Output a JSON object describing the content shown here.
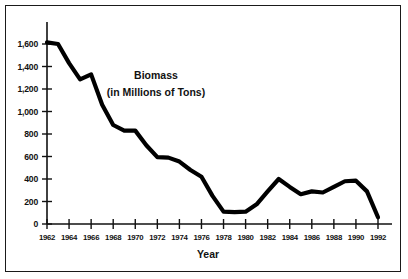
{
  "figure": {
    "background_color": "#ffffff",
    "border_color": "#1a1a1a",
    "line_color": "#000000"
  },
  "annotation": {
    "line1": "Biomass",
    "line2": "(in Millions of Tons)"
  },
  "axes": {
    "x_title": "Year",
    "y_title": ""
  },
  "chart_data": {
    "type": "line",
    "title": "",
    "subtitle": "",
    "annotations": [
      "Biomass",
      "(in Millions of Tons)"
    ],
    "xlabel": "Year",
    "ylabel": "Biomass (in Millions of Tons)",
    "xlim": [
      1961,
      1993
    ],
    "ylim": [
      0,
      1700
    ],
    "grid": false,
    "legend": false,
    "x_tick_labels": [
      "1962",
      "1964",
      "1966",
      "1968",
      "1970",
      "1972",
      "1974",
      "1976",
      "1978",
      "1980",
      "1982",
      "1984",
      "1986",
      "1988",
      "1990",
      "1992"
    ],
    "x_ticks": [
      1962,
      1964,
      1966,
      1968,
      1970,
      1972,
      1974,
      1976,
      1978,
      1980,
      1982,
      1984,
      1986,
      1988,
      1990,
      1992
    ],
    "y_tick_labels": [
      "0",
      "200",
      "400",
      "600",
      "800",
      "1,000",
      "1,200",
      "1,400",
      "1,600"
    ],
    "y_ticks": [
      0,
      200,
      400,
      600,
      800,
      1000,
      1200,
      1400,
      1600
    ],
    "x": [
      1962,
      1963,
      1964,
      1965,
      1966,
      1967,
      1968,
      1969,
      1970,
      1971,
      1972,
      1973,
      1974,
      1975,
      1976,
      1977,
      1978,
      1979,
      1980,
      1981,
      1982,
      1983,
      1984,
      1985,
      1986,
      1987,
      1988,
      1989,
      1990,
      1991,
      1992
    ],
    "values": [
      1615,
      1600,
      1430,
      1285,
      1330,
      1060,
      880,
      830,
      830,
      700,
      595,
      590,
      555,
      480,
      420,
      250,
      110,
      105,
      110,
      175,
      290,
      400,
      330,
      265,
      290,
      280,
      330,
      380,
      385,
      290,
      60
    ],
    "series": [
      {
        "name": "Biomass",
        "values": [
          1615,
          1600,
          1430,
          1285,
          1330,
          1060,
          880,
          830,
          830,
          700,
          595,
          590,
          555,
          480,
          420,
          250,
          110,
          105,
          110,
          175,
          290,
          400,
          330,
          265,
          290,
          280,
          330,
          380,
          385,
          290,
          60
        ]
      }
    ]
  }
}
